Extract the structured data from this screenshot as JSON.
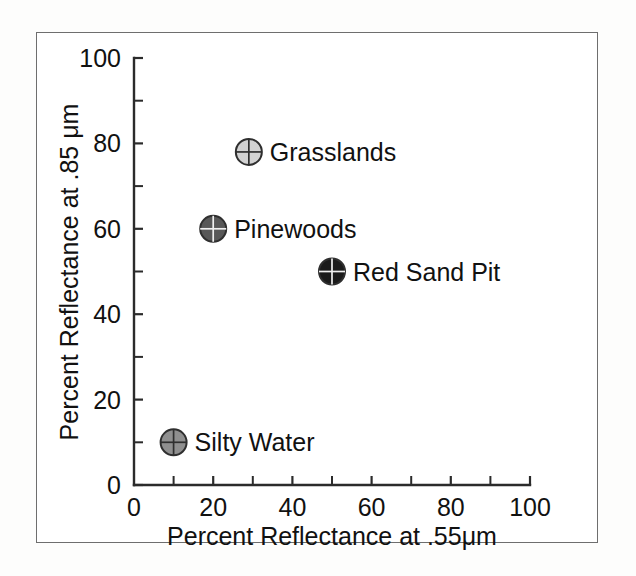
{
  "figure": {
    "background_color": "#ffffff",
    "frame_color": "#6e6e6e"
  },
  "chart_data": {
    "type": "scatter",
    "title": "",
    "xlabel": "Percent Reflectance at .55μm",
    "ylabel": "Percent Reflectance at .85 μm",
    "xlim": [
      0,
      100
    ],
    "ylim": [
      0,
      100
    ],
    "xticks": [
      0,
      20,
      40,
      60,
      80,
      100
    ],
    "yticks": [
      0,
      20,
      40,
      60,
      80,
      100
    ],
    "xtick_labels": [
      "0",
      "20",
      "40",
      "60",
      "80",
      "100"
    ],
    "ytick_labels": [
      "0",
      "20",
      "40",
      "60",
      "80",
      "100"
    ],
    "minor_tick_interval": 10,
    "grid": false,
    "legend": "none",
    "marker_style": "circle-with-crosshair",
    "points": [
      {
        "label": "Grasslands",
        "x": 29,
        "y": 78,
        "fill": "#d2d2d2",
        "edge": "#2f2f2f",
        "label_position": "right"
      },
      {
        "label": "Pinewoods",
        "x": 20,
        "y": 60,
        "fill": "#585858",
        "edge": "#2f2f2f",
        "label_position": "right"
      },
      {
        "label": "Red Sand Pit",
        "x": 50,
        "y": 50,
        "fill": "#1b1b1b",
        "edge": "#1b1b1b",
        "label_position": "right"
      },
      {
        "label": "Silty Water",
        "x": 10,
        "y": 10,
        "fill": "#8f8f8f",
        "edge": "#2f2f2f",
        "label_position": "right"
      }
    ]
  }
}
